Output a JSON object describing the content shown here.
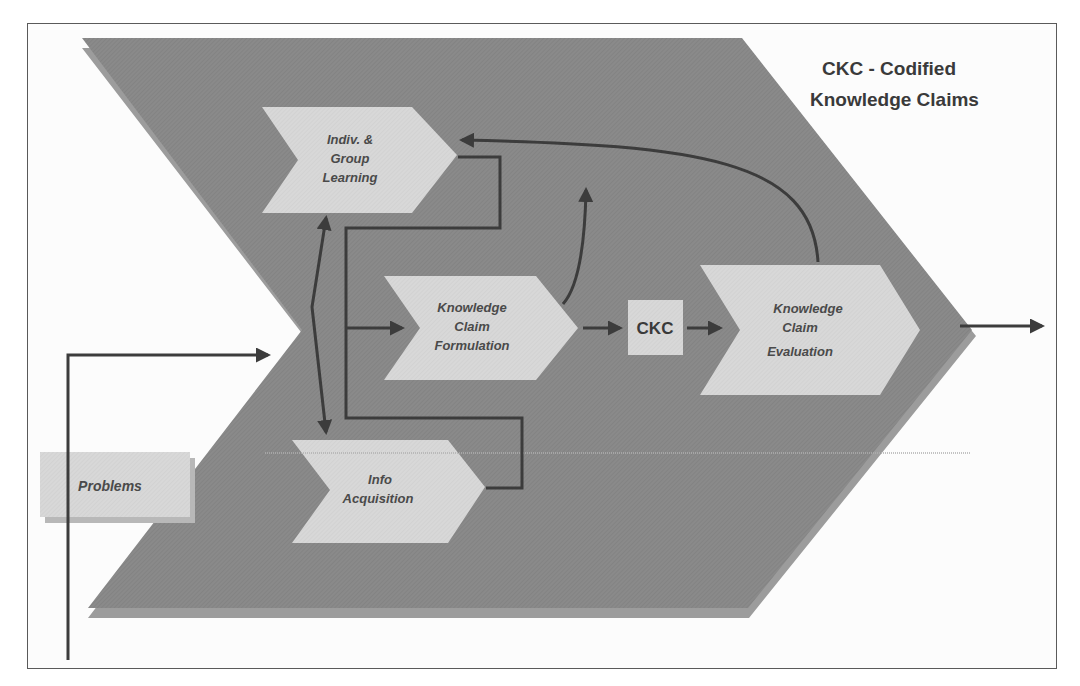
{
  "diagram": {
    "legend": {
      "line1": "CKC - Codified",
      "line2": "Knowledge Claims"
    },
    "nodes": {
      "learning": {
        "line1": "Indiv. &",
        "line2": "Group",
        "line3": "Learning"
      },
      "formulation": {
        "line1": "Knowledge",
        "line2": "Claim",
        "line3": "Formulation"
      },
      "ckc": {
        "label": "CKC"
      },
      "evaluation": {
        "line1": "Knowledge",
        "line2": "Claim",
        "line3": "Evaluation"
      },
      "acquisition": {
        "line1": "Info",
        "line2": "Acquisition"
      },
      "problems": {
        "label": "Problems"
      }
    },
    "colors": {
      "big_chevron": "#8c8c8c",
      "big_chevron_shadow": "#9a9a9a",
      "node_fill": "#d6d6d6",
      "arrow": "#3c3c3c",
      "frame": "#5a5a5a"
    }
  }
}
